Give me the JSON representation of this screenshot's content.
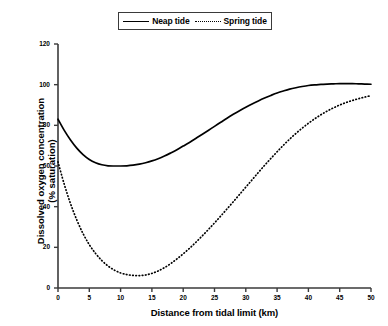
{
  "chart_data": {
    "type": "line",
    "title": "",
    "xlabel": "Distance from tidal limit (km)",
    "ylabel_line1": "Dissolved oxygen concentration",
    "ylabel_line2": "(% saturation)",
    "xlim": [
      0,
      50
    ],
    "ylim": [
      0,
      120
    ],
    "xticks": [
      0,
      5,
      10,
      15,
      20,
      25,
      30,
      35,
      40,
      45,
      50
    ],
    "yticks": [
      0,
      20,
      40,
      60,
      80,
      100,
      120
    ],
    "grid": false,
    "legend_position": "top-center",
    "x": [
      0,
      1,
      2,
      3,
      4,
      5,
      6,
      7,
      8,
      9,
      10,
      11,
      12,
      13,
      14,
      15,
      16,
      17,
      18,
      19,
      20,
      21,
      22,
      23,
      24,
      25,
      26,
      27,
      28,
      29,
      30,
      31,
      32,
      33,
      34,
      35,
      36,
      37,
      38,
      39,
      40,
      41,
      42,
      43,
      44,
      45,
      46,
      47,
      48,
      49,
      50
    ],
    "series": [
      {
        "name": "Neap tide",
        "style": "solid",
        "color": "#000000",
        "values": [
          83.0,
          77.5,
          72.8,
          68.8,
          65.6,
          63.2,
          61.6,
          60.6,
          60.1,
          60.0,
          60.0,
          60.1,
          60.4,
          60.9,
          61.6,
          62.5,
          63.6,
          64.9,
          66.4,
          68.0,
          69.8,
          71.6,
          73.5,
          75.5,
          77.5,
          79.5,
          81.5,
          83.5,
          85.4,
          87.2,
          88.9,
          90.5,
          92.0,
          93.4,
          94.7,
          95.9,
          96.9,
          97.8,
          98.5,
          99.1,
          99.6,
          99.9,
          100.1,
          100.3,
          100.4,
          100.5,
          100.5,
          100.5,
          100.4,
          100.3,
          100.2
        ]
      },
      {
        "name": "Spring tide",
        "style": "dotted",
        "color": "#000000",
        "values": [
          62.0,
          51.0,
          41.5,
          33.5,
          26.8,
          21.3,
          17.0,
          13.5,
          10.8,
          8.8,
          7.4,
          6.6,
          6.2,
          6.1,
          6.4,
          7.2,
          8.4,
          10.0,
          12.0,
          14.3,
          16.8,
          19.5,
          22.4,
          25.5,
          28.7,
          32.0,
          35.4,
          38.9,
          42.4,
          46.0,
          49.6,
          53.2,
          56.8,
          60.3,
          63.7,
          67.0,
          70.2,
          73.2,
          76.0,
          78.6,
          81.0,
          83.2,
          85.2,
          87.0,
          88.6,
          90.0,
          91.2,
          92.2,
          93.1,
          93.9,
          94.6
        ]
      }
    ],
    "legend": [
      {
        "label": "Neap tide",
        "style": "solid"
      },
      {
        "label": "Spring tide",
        "style": "dotted"
      }
    ]
  }
}
